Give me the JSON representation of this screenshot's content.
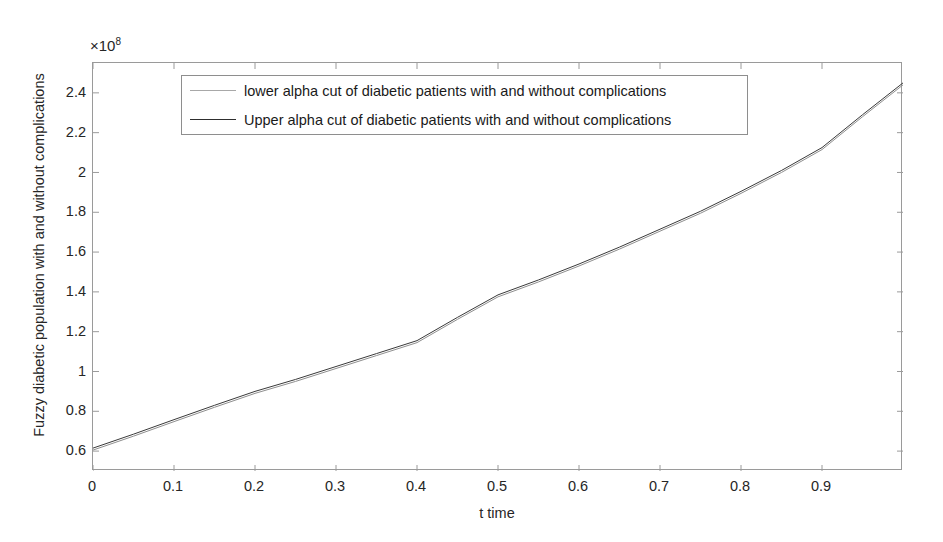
{
  "figure": {
    "background": "#ffffff"
  },
  "chart_data": {
    "type": "line",
    "title": "",
    "xlabel": "t time",
    "ylabel": "Fuzzy diabetic population with and without complications",
    "y_exponent_label": "×10",
    "y_exponent_value": "8",
    "y_scale": 100000000,
    "xlim": [
      0,
      1
    ],
    "ylim": [
      0.5,
      2.55
    ],
    "xticks": [
      0,
      0.1,
      0.2,
      0.3,
      0.4,
      0.5,
      0.6,
      0.7,
      0.8,
      0.9
    ],
    "xtick_labels": [
      "0",
      "0.1",
      "0.2",
      "0.3",
      "0.4",
      "0.5",
      "0.6",
      "0.7",
      "0.8",
      "0.9"
    ],
    "yticks": [
      0.6,
      0.8,
      1,
      1.2,
      1.4,
      1.6,
      1.8,
      2,
      2.2,
      2.4
    ],
    "ytick_labels": [
      "0.6",
      "0.8",
      "1",
      "1.2",
      "1.4",
      "1.6",
      "1.8",
      "2",
      "2.2",
      "2.4"
    ],
    "grid": false,
    "legend_position": "top-left-inside",
    "x": [
      0,
      0.05,
      0.1,
      0.15,
      0.2,
      0.25,
      0.3,
      0.35,
      0.4,
      0.45,
      0.5,
      0.55,
      0.6,
      0.65,
      0.7,
      0.75,
      0.8,
      0.85,
      0.9,
      0.95,
      1.0
    ],
    "series": [
      {
        "name": "lower alpha cut of diabetic patients with and without complications",
        "color": "#8f8f8f",
        "width": 1,
        "values": [
          0.605,
          0.675,
          0.748,
          0.82,
          0.89,
          0.95,
          1.015,
          1.08,
          1.145,
          1.262,
          1.375,
          1.45,
          1.53,
          1.615,
          1.705,
          1.795,
          1.895,
          2.0,
          2.115,
          2.28,
          2.44
        ]
      },
      {
        "name": "Upper alpha cut of diabetic patients with and without complications",
        "color": "#3a3a3a",
        "width": 1,
        "values": [
          0.615,
          0.685,
          0.758,
          0.83,
          0.9,
          0.96,
          1.025,
          1.09,
          1.155,
          1.272,
          1.385,
          1.46,
          1.54,
          1.625,
          1.715,
          1.805,
          1.905,
          2.01,
          2.125,
          2.29,
          2.45
        ]
      }
    ]
  },
  "legend": {
    "items": [
      {
        "label": "lower alpha cut of diabetic patients with and without complications",
        "color": "#a8a8a8"
      },
      {
        "label": "Upper alpha cut of diabetic patients with and without complications",
        "color": "#2e2e2e"
      }
    ]
  }
}
